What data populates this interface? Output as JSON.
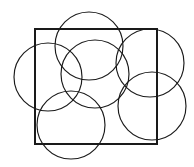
{
  "figure": {
    "canvas": {
      "width": 194,
      "height": 167,
      "background_color": "#ffffff"
    },
    "style": {
      "stroke_color": "#1a1a1a",
      "stroke_width": 1.15,
      "fill": "none"
    },
    "square": {
      "label": "square",
      "x": 35,
      "y": 29,
      "width": 122,
      "height": 115
    },
    "circles": [
      {
        "label": "circle-left",
        "cx": 48,
        "cy": 77,
        "r": 34
      },
      {
        "label": "circle-top",
        "cx": 89,
        "cy": 46,
        "r": 34
      },
      {
        "label": "circle-center",
        "cx": 95,
        "cy": 74,
        "r": 34
      },
      {
        "label": "circle-upper-right",
        "cx": 150,
        "cy": 63,
        "r": 34
      },
      {
        "label": "circle-lower-right",
        "cx": 152,
        "cy": 106,
        "r": 34
      },
      {
        "label": "circle-bottom",
        "cx": 71,
        "cy": 125,
        "r": 34
      }
    ]
  }
}
